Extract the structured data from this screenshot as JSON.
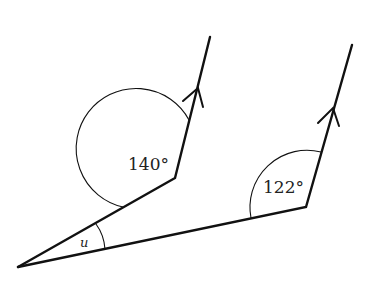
{
  "diagram": {
    "type": "angle-geometry",
    "labels": {
      "angle_upper": "140°",
      "angle_lower": "122°",
      "angle_apex": "u"
    },
    "points": {
      "apex": [
        18,
        267
      ],
      "upper_vertex": [
        175,
        178
      ],
      "upper_end": [
        210,
        37
      ],
      "lower_vertex": [
        306,
        207
      ],
      "lower_end": [
        352,
        45
      ]
    },
    "arrows": {
      "upper_arrow_at": [
        198,
        88
      ],
      "lower_arrow_at": [
        333,
        107
      ]
    },
    "colors": {
      "stroke": "#111111",
      "background": "#ffffff"
    }
  }
}
